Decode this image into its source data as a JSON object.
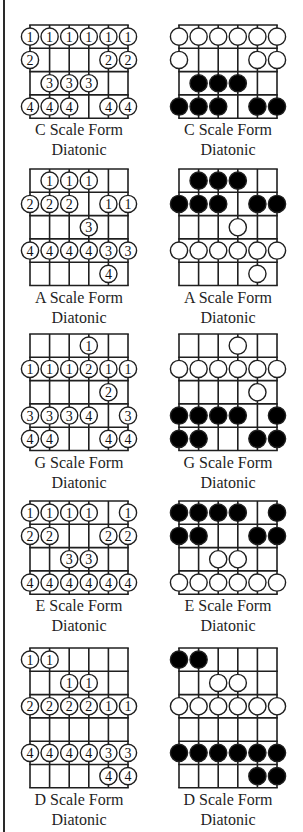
{
  "layout": {
    "string_spacing": 19.6,
    "row_height": 23.3,
    "circle_radius": 8.6,
    "columns": [
      {
        "name": "fingering",
        "grid_left": 30,
        "caption_center": 79
      },
      {
        "name": "notes",
        "grid_left": 179,
        "caption_center": 228
      }
    ]
  },
  "colors": {
    "line": "#1f1f1f",
    "filled_dot": "#000000",
    "open_dot": "#ffffff"
  },
  "diagrams": [
    {
      "id": "c",
      "top": 25,
      "rows": 4,
      "title": "C Scale Form",
      "subtitle": "Diatonic",
      "open_nut_row": true,
      "fingering": [
        [
          "1",
          "1",
          "1",
          "1",
          "1",
          "1"
        ],
        [
          "2",
          "",
          "",
          "",
          "2",
          "2"
        ],
        [
          "",
          "3",
          "3",
          "3",
          "",
          ""
        ],
        [
          "4",
          "4",
          "4",
          "",
          "4",
          "4"
        ]
      ],
      "notes": [
        [
          "o",
          "o",
          "o",
          "o",
          "o",
          "o"
        ],
        [
          "o",
          "",
          "",
          "",
          "o",
          "o"
        ],
        [
          "",
          "f",
          "f",
          "f",
          "",
          ""
        ],
        [
          "f",
          "f",
          "f",
          "",
          "f",
          "f"
        ]
      ]
    },
    {
      "id": "a",
      "top": 169,
      "rows": 5,
      "title": "A Scale Form",
      "subtitle": "Diatonic",
      "fingering": [
        [
          "",
          "1",
          "1",
          "1",
          "",
          ""
        ],
        [
          "2",
          "2",
          "2",
          "",
          "1",
          "1"
        ],
        [
          "",
          "",
          "",
          "3",
          "",
          ""
        ],
        [
          "4",
          "4",
          "4",
          "4",
          "3",
          "3"
        ],
        [
          "",
          "",
          "",
          "",
          "4",
          ""
        ]
      ],
      "notes": [
        [
          "",
          "f",
          "f",
          "f",
          "",
          ""
        ],
        [
          "f",
          "f",
          "f",
          "",
          "f",
          "f"
        ],
        [
          "",
          "",
          "",
          "o",
          "",
          ""
        ],
        [
          "o",
          "o",
          "o",
          "o",
          "o",
          "o"
        ],
        [
          "",
          "",
          "",
          "",
          "o",
          ""
        ]
      ]
    },
    {
      "id": "g",
      "top": 334,
      "rows": 5,
      "title": "G Scale Form",
      "subtitle": "Diatonic",
      "fingering": [
        [
          "",
          "",
          "",
          "1",
          "",
          ""
        ],
        [
          "1",
          "1",
          "1",
          "2",
          "1",
          "1"
        ],
        [
          "",
          "",
          "",
          "",
          "2",
          ""
        ],
        [
          "3",
          "3",
          "3",
          "4",
          "",
          "3"
        ],
        [
          "4",
          "4",
          "",
          "",
          "4",
          "4"
        ]
      ],
      "notes": [
        [
          "",
          "",
          "",
          "o",
          "",
          ""
        ],
        [
          "o",
          "o",
          "o",
          "o",
          "o",
          "o"
        ],
        [
          "",
          "",
          "",
          "",
          "o",
          ""
        ],
        [
          "f",
          "f",
          "f",
          "f",
          "",
          "f"
        ],
        [
          "f",
          "f",
          "",
          "",
          "f",
          "f"
        ]
      ]
    },
    {
      "id": "e",
      "top": 501,
      "rows": 4,
      "title": "E Scale Form",
      "subtitle": "Diatonic",
      "fingering": [
        [
          "1",
          "1",
          "1",
          "1",
          "",
          "1"
        ],
        [
          "2",
          "2",
          "",
          "",
          "2",
          "2"
        ],
        [
          "",
          "",
          "3",
          "3",
          "",
          ""
        ],
        [
          "4",
          "4",
          "4",
          "4",
          "4",
          "4"
        ]
      ],
      "notes": [
        [
          "f",
          "f",
          "f",
          "f",
          "",
          "f"
        ],
        [
          "f",
          "f",
          "",
          "",
          "f",
          "f"
        ],
        [
          "",
          "",
          "o",
          "o",
          "",
          ""
        ],
        [
          "o",
          "o",
          "o",
          "o",
          "o",
          "o"
        ]
      ]
    },
    {
      "id": "d",
      "top": 648,
      "rows": 6,
      "title": "D Scale Form",
      "subtitle": "Diatonic",
      "fingering": [
        [
          "1",
          "1",
          "",
          "",
          "",
          ""
        ],
        [
          "",
          "",
          "1",
          "1",
          "",
          ""
        ],
        [
          "2",
          "2",
          "2",
          "2",
          "1",
          "1"
        ],
        [
          "",
          "",
          "",
          "",
          "",
          ""
        ],
        [
          "4",
          "4",
          "4",
          "4",
          "3",
          "3"
        ],
        [
          "",
          "",
          "",
          "",
          "4",
          "4"
        ]
      ],
      "notes": [
        [
          "f",
          "f",
          "",
          "",
          "",
          ""
        ],
        [
          "",
          "",
          "o",
          "o",
          "",
          ""
        ],
        [
          "o",
          "o",
          "o",
          "o",
          "o",
          "o"
        ],
        [
          "",
          "",
          "",
          "",
          "",
          ""
        ],
        [
          "f",
          "f",
          "f",
          "f",
          "f",
          "f"
        ],
        [
          "",
          "",
          "",
          "",
          "f",
          "f"
        ]
      ]
    }
  ]
}
